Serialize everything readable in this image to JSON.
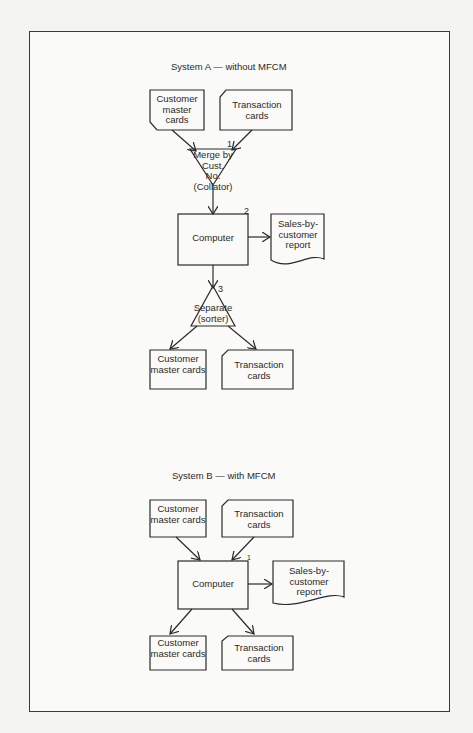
{
  "system_a": {
    "title": "System A — without MFCM",
    "customer_master_top": "Customer master cards",
    "transaction_top": "Transaction cards",
    "merge": {
      "step": "1",
      "line1": "Merge by",
      "line2": "Cust.",
      "line3": "No.",
      "line4": "(Collator)"
    },
    "computer": {
      "step": "2",
      "label": "Computer"
    },
    "report": "Sales-by-customer report",
    "separate": {
      "step": "3",
      "line1": "Separate",
      "line2": "(sorter)"
    },
    "customer_master_bottom": "Customer master cards",
    "transaction_bottom": "Transaction cards"
  },
  "system_b": {
    "title": "System B — with MFCM",
    "customer_master_top": "Customer master cards",
    "transaction_top": "Transaction cards",
    "computer": {
      "step": "1",
      "label": "Computer"
    },
    "report": "Sales-by-customer report",
    "customer_master_bottom": "Customer master cards",
    "transaction_bottom": "Transaction cards"
  }
}
